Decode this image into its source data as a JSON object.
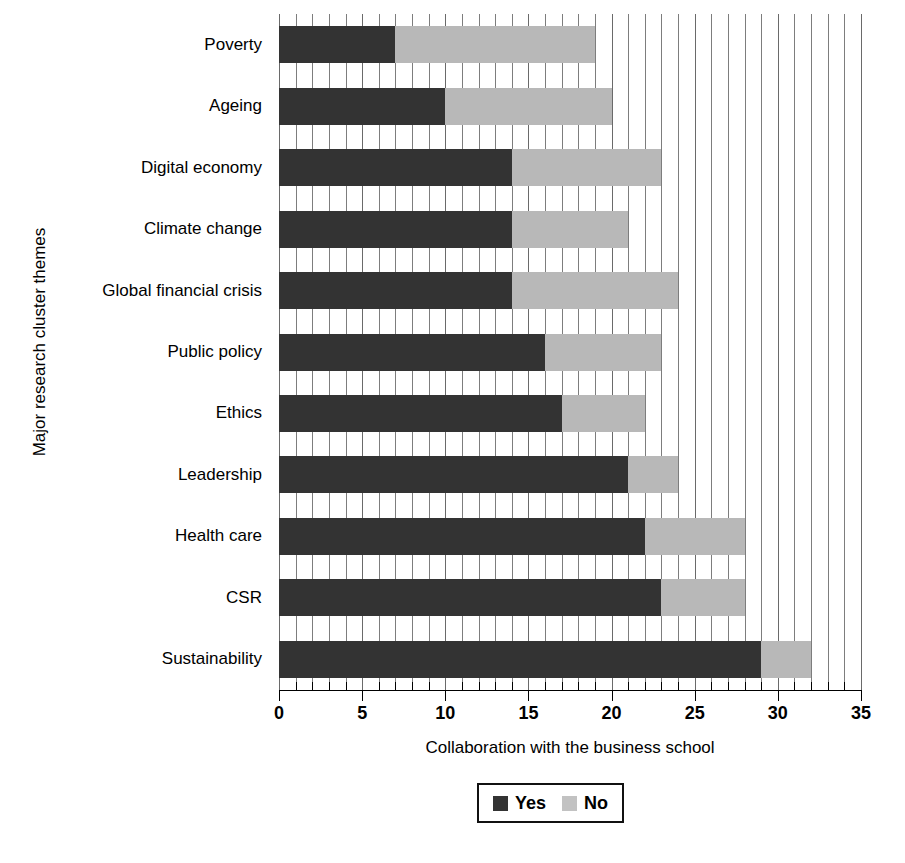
{
  "chart_data": {
    "type": "bar",
    "orientation": "horizontal",
    "stacked": true,
    "title": "",
    "xlabel": "Collaboration with the business school",
    "ylabel": "Major research cluster themes",
    "xlim": [
      0,
      35
    ],
    "xticks": [
      0,
      5,
      10,
      15,
      20,
      25,
      30,
      35
    ],
    "xtick_labels": [
      "0",
      "5",
      "10",
      "15",
      "20",
      "25",
      "30",
      "35"
    ],
    "minor_tick_step": 1,
    "grid": "vertical-minor",
    "legend_position": "below-axis-center",
    "categories": [
      "Poverty",
      "Ageing",
      "Digital economy",
      "Climate change",
      "Global financial crisis",
      "Public policy",
      "Ethics",
      "Leadership",
      "Health care",
      "CSR",
      "Sustainability"
    ],
    "series": [
      {
        "name": "Yes",
        "color": "#333333",
        "values": [
          7,
          10,
          14,
          14,
          14,
          16,
          17,
          21,
          22,
          23,
          29
        ]
      },
      {
        "name": "No",
        "color": "#b8b8b8",
        "values": [
          12,
          10,
          9,
          7,
          10,
          7,
          5,
          3,
          6,
          5,
          3
        ]
      }
    ],
    "totals": [
      19,
      20,
      23,
      21,
      24,
      23,
      22,
      24,
      28,
      28,
      32
    ]
  },
  "legend": {
    "entries": [
      {
        "label": "Yes",
        "color": "#333333"
      },
      {
        "label": "No",
        "color": "#c2c2c2"
      }
    ]
  },
  "axis": {
    "x_title": "Collaboration with the business school",
    "y_title": "Major research cluster themes"
  }
}
